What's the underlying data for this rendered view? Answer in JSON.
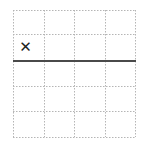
{
  "board": {
    "columns": 4,
    "rows": 5,
    "col_lines": [
      13,
      44,
      74,
      105,
      135
    ],
    "row_lines": [
      10,
      34,
      61,
      86,
      111,
      137
    ],
    "grid_color": "#b5b5b5",
    "divider": {
      "row_index": 2,
      "color": "#4a4a4a",
      "width": 2
    },
    "marks": [
      {
        "row": 1,
        "col": 0,
        "symbol": "✕",
        "name": "x-mark-icon"
      }
    ]
  }
}
